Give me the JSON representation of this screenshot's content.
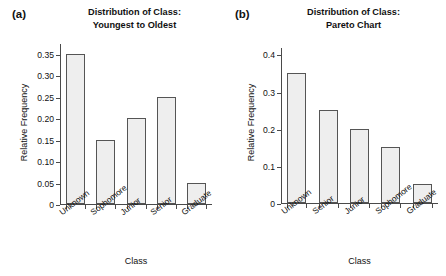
{
  "figure": {
    "panels": [
      {
        "tag": "(a)",
        "title_line1": "Distribution of Class:",
        "title_line2": "Youngest to Oldest",
        "xlabel": "Class",
        "ylabel": "Relative Frequency"
      },
      {
        "tag": "(b)",
        "title_line1": "Distribution of Class:",
        "title_line2": "Pareto Chart",
        "xlabel": "Class",
        "ylabel": "Relative Frequency"
      }
    ]
  },
  "chart_data": [
    {
      "type": "bar",
      "title": "Distribution of Class: Youngest to Oldest",
      "xlabel": "Class",
      "ylabel": "Relative Frequency",
      "categories": [
        "Unknown",
        "Sophomore",
        "Junior",
        "Senior",
        "Graduate"
      ],
      "values": [
        0.35,
        0.15,
        0.2,
        0.25,
        0.05
      ],
      "ylim": [
        0,
        0.375
      ],
      "yticks": [
        0,
        0.05,
        0.1,
        0.15,
        0.2,
        0.25,
        0.3,
        0.35
      ],
      "ytick_labels": [
        "0",
        "0.05",
        "0.10",
        "0.15",
        "0.20",
        "0.25",
        "0.30",
        "0.35"
      ],
      "grid": false,
      "legend": "none",
      "bar_fill": "#eeeeee",
      "bar_edge": "#555555"
    },
    {
      "type": "bar",
      "title": "Distribution of Class: Pareto Chart",
      "xlabel": "Class",
      "ylabel": "Relative Frequency",
      "categories": [
        "Unknown",
        "Senior",
        "Junior",
        "Sophomore",
        "Graduate"
      ],
      "values": [
        0.35,
        0.25,
        0.2,
        0.15,
        0.05
      ],
      "ylim": [
        0,
        0.42
      ],
      "yticks": [
        0,
        0.1,
        0.2,
        0.3,
        0.4
      ],
      "ytick_labels": [
        "0",
        "0.1",
        "0.2",
        "0.3",
        "0.4"
      ],
      "grid": false,
      "legend": "none",
      "bar_fill": "#eeeeee",
      "bar_edge": "#555555"
    }
  ]
}
